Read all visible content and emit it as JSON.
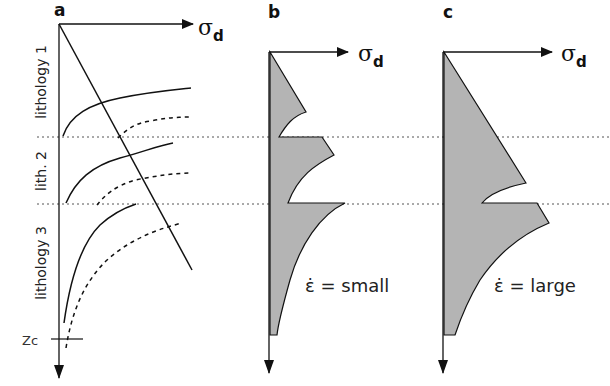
{
  "figure": {
    "panels": [
      {
        "id": "a",
        "label": "a",
        "axis_label": "σ",
        "axis_subscript": "d"
      },
      {
        "id": "b",
        "label": "b",
        "axis_label": "σ",
        "axis_subscript": "d",
        "annotation_symbol": "ε̇",
        "annotation_text": "= small"
      },
      {
        "id": "c",
        "label": "c",
        "axis_label": "σ",
        "axis_subscript": "d",
        "annotation_symbol": "ε̇",
        "annotation_text": "= large"
      }
    ],
    "lithology_labels": [
      "lithology 1",
      "lith. 2",
      "lithology 3"
    ],
    "depth_marker": "Zc",
    "colors": {
      "fill": "#b4b4b4",
      "stroke": "#111111",
      "dotted": "#555555"
    }
  }
}
